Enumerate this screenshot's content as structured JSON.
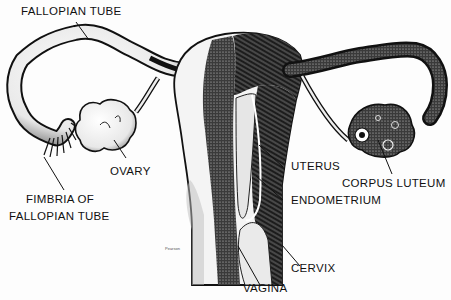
{
  "diagram": {
    "labels": {
      "fallopian_tube": "FALLOPIAN TUBE",
      "ovary": "OVARY",
      "fimbria_line1": "FIMBRIA OF",
      "fimbria_line2": "FALLOPIAN TUBE",
      "uterus": "UTERUS",
      "corpus_luteum": "CORPUS LUTEUM",
      "endometrium": "ENDOMETRIUM",
      "cervix": "CERVIX",
      "vagina": "VAGINA"
    },
    "signature": "Pearson",
    "colors": {
      "ink": "#111111",
      "shade": "#2a2a2a",
      "light": "#f2f2f2",
      "paper": "#fdfdfd"
    }
  }
}
